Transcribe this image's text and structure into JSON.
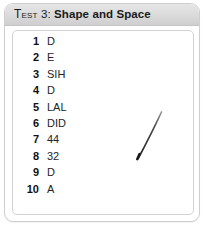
{
  "card": {
    "header": {
      "label_prefix": "Test",
      "label_number": " 3: ",
      "label_title": "Shape and Space",
      "full_text": "Test 3: Shape and Space"
    },
    "answers": {
      "columns": [
        "number",
        "answer"
      ],
      "rows": [
        {
          "number": "1",
          "answer": "D"
        },
        {
          "number": "2",
          "answer": "E"
        },
        {
          "number": "3",
          "answer": "SIH"
        },
        {
          "number": "4",
          "answer": "D"
        },
        {
          "number": "5",
          "answer": "LAL"
        },
        {
          "number": "6",
          "answer": "DID"
        },
        {
          "number": "7",
          "answer": "44"
        },
        {
          "number": "8",
          "answer": "32"
        },
        {
          "number": "9",
          "answer": "D"
        },
        {
          "number": "10",
          "answer": "A"
        }
      ]
    },
    "annotation": {
      "name": "diagonal-pen-stroke",
      "color": "#2b2b2b"
    }
  },
  "colors": {
    "page_background": "#ffffff",
    "card_border": "#cfcfcf",
    "header_gradient_top": "#e6e6e6",
    "header_gradient_bottom": "#cfcfcf",
    "panel_border": "#d2d2d2",
    "text": "#111111",
    "answer_text": "#242424"
  }
}
